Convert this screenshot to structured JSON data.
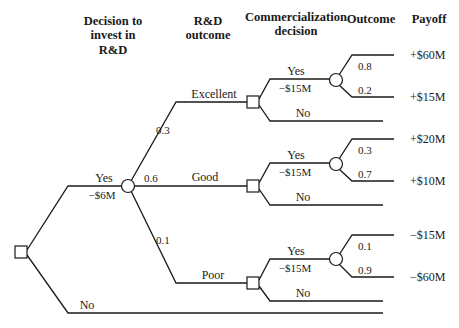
{
  "headers": {
    "decision_invest": [
      "Decision to",
      "invest in",
      "R&D"
    ],
    "rd_outcome": [
      "R&D",
      "outcome"
    ],
    "commercialization": [
      "Commercialization",
      "decision"
    ],
    "outcome": "Outcome",
    "payoff": "Payoff"
  },
  "root": {
    "yes_label": "Yes",
    "yes_cost": "−$6M",
    "no_label": "No"
  },
  "rd_branches": [
    {
      "name": "Excellent",
      "probability": "0.3",
      "commercialize": {
        "yes_label": "Yes",
        "yes_cost": "−$15M",
        "no_label": "No",
        "outcomes": [
          {
            "probability": "0.8",
            "payoff": "+$60M"
          },
          {
            "probability": "0.2",
            "payoff": "+$15M"
          }
        ]
      }
    },
    {
      "name": "Good",
      "probability": "0.6",
      "commercialize": {
        "yes_label": "Yes",
        "yes_cost": "−$15M",
        "no_label": "No",
        "outcomes": [
          {
            "probability": "0.3",
            "payoff": "+$20M"
          },
          {
            "probability": "0.7",
            "payoff": "+$10M"
          }
        ]
      }
    },
    {
      "name": "Poor",
      "probability": "0.1",
      "commercialize": {
        "yes_label": "Yes",
        "yes_cost": "−$15M",
        "no_label": "No",
        "outcomes": [
          {
            "probability": "0.1",
            "payoff": "−$15M"
          },
          {
            "probability": "0.9",
            "payoff": "−$60M"
          }
        ]
      }
    }
  ],
  "colors": {
    "line": "#1a1a1a",
    "background": "#ffffff"
  }
}
